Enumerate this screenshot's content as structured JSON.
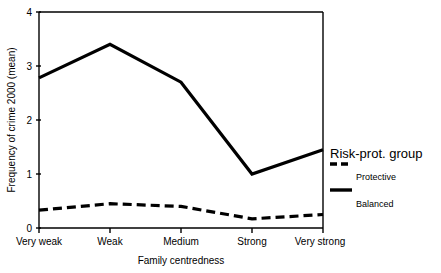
{
  "chart_data": {
    "type": "line",
    "title": "",
    "xlabel": "Family centredness",
    "ylabel": "Frequency of crime 2000 (mean)",
    "categories": [
      "Very weak",
      "Weak",
      "Medium",
      "Strong",
      "Very strong"
    ],
    "ylim": [
      0,
      4
    ],
    "yticks": [
      0,
      1,
      2,
      3,
      4
    ],
    "ytick_labels": [
      "0",
      "1",
      "2",
      "3",
      "4"
    ],
    "grid": false,
    "legend_position": "right",
    "legend_title": "Risk-prot. group",
    "series": [
      {
        "name": "Protective",
        "style": "solid",
        "color": "#000000",
        "values": [
          2.78,
          3.4,
          2.7,
          1.0,
          1.45
        ]
      },
      {
        "name": "Balanced",
        "style": "dashed",
        "color": "#000000",
        "values": [
          0.33,
          0.45,
          0.4,
          0.17,
          0.25
        ]
      }
    ]
  },
  "legend": {
    "title": "Risk-prot. group",
    "entries": [
      {
        "label": "Protective",
        "style": "dashed"
      },
      {
        "label": "Balanced",
        "style": "solid"
      }
    ]
  },
  "axes": {
    "y_title": "Frequency of crime 2000 (mean)",
    "x_title": "Family centredness",
    "y_ticks": [
      "4",
      "3",
      "2",
      "1",
      "0"
    ],
    "x_ticks": [
      "Very weak",
      "Weak",
      "Medium",
      "Strong",
      "Very strong"
    ]
  }
}
